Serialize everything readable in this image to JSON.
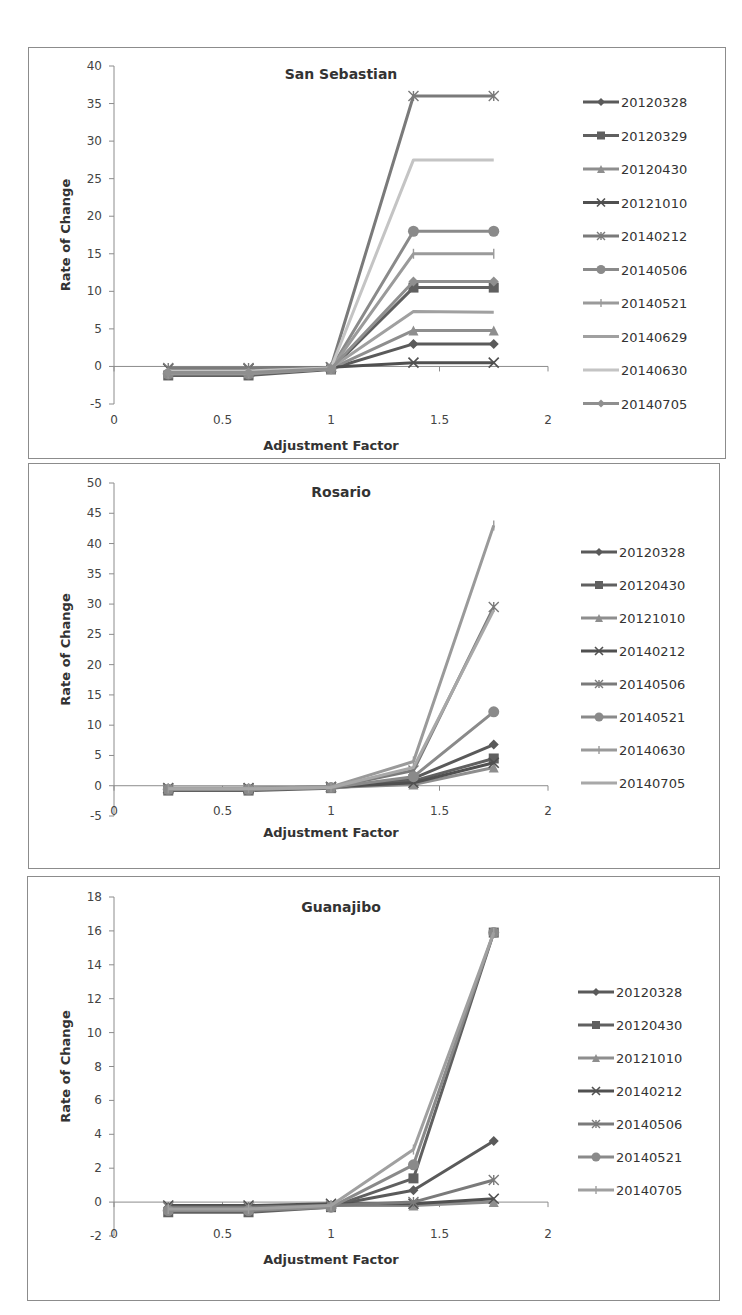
{
  "chart_data": [
    {
      "type": "line",
      "title": "San Sebastian",
      "xlabel": "Adjustment Factor",
      "ylabel": "Rate of Change",
      "xlim": [
        0,
        2
      ],
      "ylim": [
        -5,
        40
      ],
      "xticks": [
        "0",
        "0.5",
        "1",
        "1.5",
        "2"
      ],
      "yticks": [
        "-5",
        "0",
        "5",
        "10",
        "15",
        "20",
        "25",
        "30",
        "35",
        "40"
      ],
      "grid": false,
      "legend_position": "right",
      "x": [
        0.25,
        0.62,
        1.0,
        1.38,
        1.75
      ],
      "series": [
        {
          "name": "20120328",
          "marker": "diamond",
          "color": "#5a5a5a",
          "values": [
            -0.8,
            -0.8,
            -0.3,
            3.0,
            3.0
          ]
        },
        {
          "name": "20120329",
          "marker": "square",
          "color": "#606060",
          "values": [
            -1.2,
            -1.2,
            -0.4,
            10.5,
            10.5
          ]
        },
        {
          "name": "20120430",
          "marker": "triangle",
          "color": "#8e8e8e",
          "values": [
            -0.9,
            -0.9,
            -0.3,
            4.8,
            4.8
          ]
        },
        {
          "name": "20121010",
          "marker": "x",
          "color": "#505050",
          "values": [
            -0.3,
            -0.3,
            -0.1,
            0.5,
            0.5
          ]
        },
        {
          "name": "20140212",
          "marker": "star",
          "color": "#7a7a7a",
          "values": [
            -0.2,
            -0.2,
            -0.1,
            36.0,
            36.0
          ]
        },
        {
          "name": "20140506",
          "marker": "circle",
          "color": "#8a8a8a",
          "values": [
            -1.0,
            -1.0,
            -0.3,
            18.0,
            18.0
          ]
        },
        {
          "name": "20140521",
          "marker": "plus",
          "color": "#9a9a9a",
          "values": [
            -0.9,
            -0.9,
            -0.3,
            15.0,
            15.0
          ]
        },
        {
          "name": "20140629",
          "marker": "none",
          "color": "#a0a0a0",
          "values": [
            -0.7,
            -0.7,
            -0.2,
            7.3,
            7.2
          ]
        },
        {
          "name": "20140630",
          "marker": "none",
          "color": "#c4c4c4",
          "values": [
            -0.6,
            -0.6,
            -0.2,
            27.5,
            27.5
          ]
        },
        {
          "name": "20140705",
          "marker": "diamond",
          "color": "#8f8f8f",
          "values": [
            -0.8,
            -0.8,
            -0.3,
            11.3,
            11.3
          ]
        }
      ]
    },
    {
      "type": "line",
      "title": "Rosario",
      "xlabel": "Adjustment Factor",
      "ylabel": "Rate of Change",
      "xlim": [
        0,
        2
      ],
      "ylim": [
        -5,
        50
      ],
      "xticks": [
        "0",
        "0.5",
        "1",
        "1.5",
        "2"
      ],
      "yticks": [
        "-5",
        "0",
        "5",
        "10",
        "15",
        "20",
        "25",
        "30",
        "35",
        "40",
        "45",
        "50"
      ],
      "grid": false,
      "legend_position": "right",
      "x": [
        0.25,
        0.62,
        1.0,
        1.38,
        1.75
      ],
      "series": [
        {
          "name": "20120328",
          "marker": "diamond",
          "color": "#5a5a5a",
          "values": [
            -0.5,
            -0.5,
            -0.3,
            1.2,
            6.8
          ]
        },
        {
          "name": "20120430",
          "marker": "square",
          "color": "#606060",
          "values": [
            -0.8,
            -0.8,
            -0.4,
            0.8,
            4.5
          ]
        },
        {
          "name": "20121010",
          "marker": "triangle",
          "color": "#8e8e8e",
          "values": [
            -0.6,
            -0.6,
            -0.3,
            0.2,
            3.0
          ]
        },
        {
          "name": "20140212",
          "marker": "x",
          "color": "#505050",
          "values": [
            -0.4,
            -0.4,
            -0.2,
            0.5,
            3.8
          ]
        },
        {
          "name": "20140506",
          "marker": "star",
          "color": "#7a7a7a",
          "values": [
            -0.5,
            -0.5,
            -0.3,
            2.5,
            29.5
          ]
        },
        {
          "name": "20140521",
          "marker": "circle",
          "color": "#8a8a8a",
          "values": [
            -0.6,
            -0.6,
            -0.3,
            1.5,
            12.2
          ]
        },
        {
          "name": "20140630",
          "marker": "plus",
          "color": "#9a9a9a",
          "values": [
            -0.4,
            -0.4,
            -0.2,
            4.0,
            43.0
          ]
        },
        {
          "name": "20140705",
          "marker": "none",
          "color": "#a8a8a8",
          "values": [
            -0.5,
            -0.5,
            -0.3,
            3.0,
            29.0
          ]
        }
      ]
    },
    {
      "type": "line",
      "title": "Guanajibo",
      "xlabel": "Adjustment Factor",
      "ylabel": "Rate of Change",
      "xlim": [
        0,
        2
      ],
      "ylim": [
        -2,
        18
      ],
      "xticks": [
        "0",
        "0.5",
        "1",
        "1.5",
        "2"
      ],
      "yticks": [
        "-2",
        "0",
        "2",
        "4",
        "6",
        "8",
        "10",
        "12",
        "14",
        "16",
        "18"
      ],
      "grid": false,
      "legend_position": "right",
      "x": [
        0.25,
        0.62,
        1.0,
        1.38,
        1.75
      ],
      "series": [
        {
          "name": "20120328",
          "marker": "diamond",
          "color": "#5a5a5a",
          "values": [
            -0.3,
            -0.3,
            -0.2,
            0.7,
            3.6
          ]
        },
        {
          "name": "20120430",
          "marker": "square",
          "color": "#606060",
          "values": [
            -0.6,
            -0.6,
            -0.3,
            1.4,
            15.9
          ]
        },
        {
          "name": "20121010",
          "marker": "triangle",
          "color": "#8e8e8e",
          "values": [
            -0.4,
            -0.4,
            -0.2,
            -0.2,
            0.0
          ]
        },
        {
          "name": "20140212",
          "marker": "x",
          "color": "#505050",
          "values": [
            -0.2,
            -0.2,
            -0.1,
            -0.1,
            0.2
          ]
        },
        {
          "name": "20140506",
          "marker": "star",
          "color": "#7a7a7a",
          "values": [
            -0.3,
            -0.3,
            -0.2,
            0.0,
            1.3
          ]
        },
        {
          "name": "20140521",
          "marker": "circle",
          "color": "#8a8a8a",
          "values": [
            -0.5,
            -0.5,
            -0.3,
            2.2,
            15.9
          ]
        },
        {
          "name": "20140705",
          "marker": "plus",
          "color": "#a0a0a0",
          "values": [
            -0.4,
            -0.4,
            -0.2,
            3.1,
            15.9
          ]
        }
      ]
    }
  ],
  "layout": {
    "frames": [
      {
        "left": 28,
        "top": 47,
        "width": 697,
        "height": 411,
        "plot": {
          "x0": 114,
          "x2": 548,
          "ytop": 66,
          "ybottom": 404,
          "title_y": 79,
          "xticks_y": 424,
          "xlabel_y": 450,
          "ylabel_x": 70
        },
        "legend": {
          "x": 583,
          "y0": 102,
          "dy": 33.5
        }
      },
      {
        "left": 28,
        "top": 463,
        "width": 691,
        "height": 405,
        "plot": {
          "x0": 114,
          "x2": 548,
          "ytop": 483,
          "ybottom": 816,
          "title_y": 497,
          "xticks_y": 815,
          "xlabel_y": 837,
          "ylabel_x": 70
        },
        "legend": {
          "x": 581,
          "y0": 552,
          "dy": 33
        }
      },
      {
        "left": 27,
        "top": 876,
        "width": 692,
        "height": 424,
        "plot": {
          "x0": 114,
          "x2": 548,
          "ytop": 897,
          "ybottom": 1236,
          "title_y": 912,
          "xticks_y": 1238,
          "xlabel_y": 1264,
          "ylabel_x": 70
        },
        "legend": {
          "x": 578,
          "y0": 992,
          "dy": 33
        }
      }
    ]
  }
}
